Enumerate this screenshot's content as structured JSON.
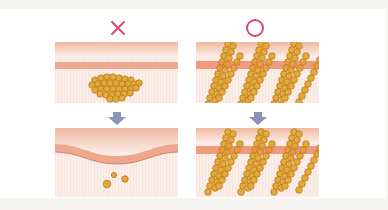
{
  "diagram": {
    "type": "comparison-illustration",
    "colors": {
      "page_bg": "#f7f5f1",
      "card_bg": "#ffffff",
      "tissue": "#fbeee8",
      "band": "#eea88e",
      "surface_top": "#f0b8a0",
      "cell_fill": "#e3a93a",
      "cell_stroke": "#b97a1a",
      "marker": "#d94a72",
      "arrow": "#8a93b8"
    },
    "columns": [
      {
        "id": "bad",
        "marker_symbol": "✕",
        "marker_meaning": "incorrect",
        "before": "clustered cells below surface band",
        "after": "surface dips, few scattered cells remain"
      },
      {
        "id": "good",
        "marker_symbol": "○",
        "marker_meaning": "correct",
        "before": "diagonal rows of cells crossing surface band",
        "after": "diagonal rows of cells persist"
      }
    ],
    "arrow_symbol": "down-arrow"
  }
}
